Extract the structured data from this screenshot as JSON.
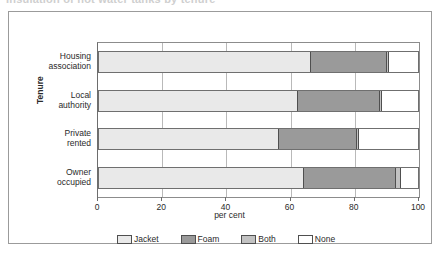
{
  "figure": {
    "title_cropped": "Insulation of hot water tanks by tenure",
    "frame_color": "#9b9b9b",
    "background": "#ffffff"
  },
  "chart_data": {
    "type": "bar",
    "orientation": "horizontal",
    "stacked": true,
    "title": "",
    "xlabel": "per cent",
    "ylabel": "Tenure",
    "xlim": [
      0,
      100
    ],
    "xticks": [
      0,
      20,
      40,
      60,
      80,
      100
    ],
    "xtick_labels": [
      "0",
      "20",
      "40",
      "60",
      "80",
      "100"
    ],
    "grid": "vertical",
    "legend_position": "bottom",
    "categories": [
      "Housing association",
      "Local authority",
      "Private rented",
      "Owner occupied"
    ],
    "category_lines": [
      [
        "Housing",
        "association"
      ],
      [
        "Local",
        "authority"
      ],
      [
        "Private",
        "rented"
      ],
      [
        "Owner",
        "occupied"
      ]
    ],
    "series": [
      {
        "name": "Jacket",
        "color": "#e9e9e9",
        "values": [
          66.0,
          62.0,
          56.0,
          64.0
        ]
      },
      {
        "name": "Foam",
        "color": "#9a9a9a",
        "values": [
          24.0,
          25.8,
          24.5,
          28.8
        ]
      },
      {
        "name": "Both",
        "color": "#c2c2c2",
        "values": [
          0.6,
          0.5,
          0.8,
          1.7
        ]
      },
      {
        "name": "None",
        "color": "#ffffff",
        "values": [
          9.4,
          11.7,
          18.7,
          5.5
        ]
      }
    ]
  },
  "legend": {
    "items": [
      {
        "label": "Jacket",
        "color": "#e9e9e9"
      },
      {
        "label": "Foam",
        "color": "#9a9a9a"
      },
      {
        "label": "Both",
        "color": "#c2c2c2"
      },
      {
        "label": "None",
        "color": "#ffffff"
      }
    ]
  }
}
